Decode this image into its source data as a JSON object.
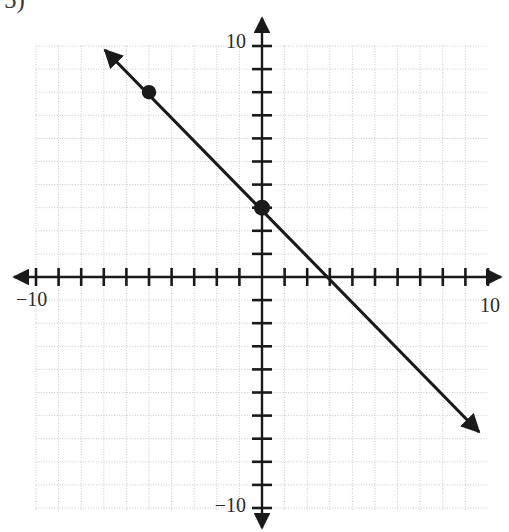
{
  "problem": {
    "number_label": "5)"
  },
  "figure": {
    "kind": "coordinate-plane-line-graph",
    "background_color": "#ffffff",
    "grid_color": "#c9c9c9",
    "axis_color": "#1a1a1a",
    "line_color": "#1a1a1a",
    "point_color": "#1a1a1a"
  },
  "axes": {
    "x_label_positive": "10",
    "x_label_negative": "−10",
    "y_label_positive": "10",
    "y_label_negative": "−10",
    "x_min": -10,
    "x_max": 10,
    "y_min": -10,
    "y_max": 10,
    "tick_step": 1,
    "grid": "on",
    "arrowheads": "both-ends"
  },
  "chart_data": {
    "type": "line",
    "title": "",
    "xlabel": "",
    "ylabel": "",
    "xlim": [
      -10,
      10
    ],
    "ylim": [
      -10,
      10
    ],
    "grid": true,
    "legend": "none",
    "series": [
      {
        "name": "line",
        "equation": "y = -x + 3",
        "slope": -1,
        "y_intercept": 3,
        "x_intercept": 3,
        "x": [
          -7,
          9
        ],
        "values": [
          10,
          -6
        ],
        "arrow_start": true,
        "arrow_end": true
      }
    ],
    "points": [
      {
        "label": "(-5, 8)",
        "x": -5,
        "y": 8
      },
      {
        "label": "(0, 3)",
        "x": 0,
        "y": 3
      }
    ],
    "x_ticks": [
      -10,
      -9,
      -8,
      -7,
      -6,
      -5,
      -4,
      -3,
      -2,
      -1,
      0,
      1,
      2,
      3,
      4,
      5,
      6,
      7,
      8,
      9,
      10
    ],
    "y_ticks": [
      -10,
      -9,
      -8,
      -7,
      -6,
      -5,
      -4,
      -3,
      -2,
      -1,
      0,
      1,
      2,
      3,
      4,
      5,
      6,
      7,
      8,
      9,
      10
    ],
    "x_tick_labels": [
      "−10",
      "10"
    ],
    "y_tick_labels": [
      "−10",
      "10"
    ]
  },
  "geometry": {
    "origin_px": {
      "x": 262,
      "y": 277
    },
    "unit_px_x": 22.6,
    "unit_px_y": 23.1,
    "grid_left_px": 36,
    "grid_right_px": 487,
    "grid_top_px": 46,
    "grid_bottom_px": 510
  }
}
